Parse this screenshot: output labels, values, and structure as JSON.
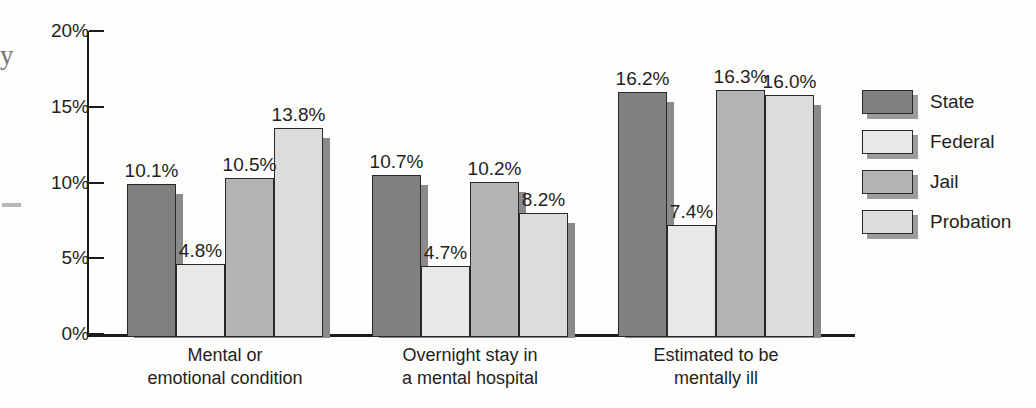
{
  "chart_data": {
    "type": "bar",
    "title": "",
    "subtitle": "",
    "xlabel": "",
    "ylabel": "",
    "ylim": [
      0,
      20
    ],
    "grid": false,
    "legend_position": "right",
    "tick_suffix": "%",
    "categories": [
      "Mental or\nemotional condition",
      "Overnight stay in\na mental hospital",
      "Estimated to be\nmentally ill"
    ],
    "category_lines": [
      [
        "Mental or",
        "emotional condition"
      ],
      [
        "Overnight stay in",
        "a mental hospital"
      ],
      [
        "Estimated to be",
        "mentally ill"
      ]
    ],
    "ytick_labels": [
      "20%",
      "15%",
      "10%",
      "5%",
      "0%"
    ],
    "ytick_values": [
      20,
      15,
      10,
      5,
      0
    ],
    "series": [
      {
        "name": "State",
        "color": "#808080",
        "values": [
          10.1,
          10.7,
          16.2
        ],
        "labels": [
          "10.1%",
          "10.7%",
          "16.2%"
        ]
      },
      {
        "name": "Federal",
        "color": "#e8e8e8",
        "values": [
          4.8,
          4.7,
          7.4
        ],
        "labels": [
          "4.8%",
          "4.7%",
          "7.4%"
        ]
      },
      {
        "name": "Jail",
        "color": "#b4b4b4",
        "values": [
          10.5,
          10.2,
          16.3
        ],
        "labels": [
          "10.5%",
          "10.2%",
          "16.3%"
        ]
      },
      {
        "name": "Probation",
        "color": "#dcdcdc",
        "values": [
          13.8,
          8.2,
          16.0
        ],
        "labels": [
          "13.8%",
          "8.2%",
          "16.0%"
        ]
      }
    ]
  },
  "legend": {
    "items": [
      {
        "label": "State",
        "color": "#808080"
      },
      {
        "label": "Federal",
        "color": "#e8e8e8"
      },
      {
        "label": "Jail",
        "color": "#b4b4b4"
      },
      {
        "label": "Probation",
        "color": "#dcdcdc"
      }
    ]
  },
  "artifacts": {
    "edge_glyph": "y"
  }
}
